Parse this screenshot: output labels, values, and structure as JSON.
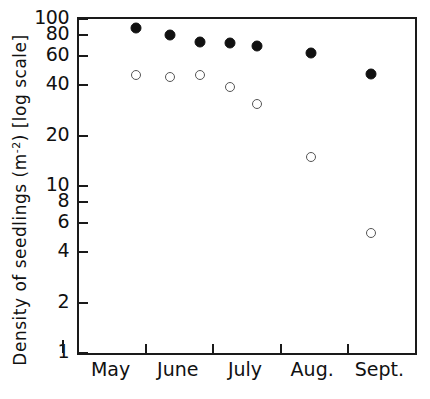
{
  "chart_data": {
    "type": "scatter",
    "title": "",
    "xlabel": "",
    "ylabel": "Density of seedlings (m-2) [log scale]",
    "ylabel_parts": {
      "main": "Density of seedlings (m",
      "sup": "-2",
      "tail": ") [log scale]"
    },
    "yscale": "log",
    "ylim": [
      1,
      100
    ],
    "ytick_values": [
      100,
      80,
      60,
      40,
      20,
      10,
      8,
      6,
      4,
      2,
      1
    ],
    "ytick_labels": [
      "100",
      "80",
      "60",
      "40",
      "20",
      "10",
      "8",
      "6",
      "4",
      "2",
      "1"
    ],
    "categories": [
      "May",
      "June",
      "July",
      "Aug.",
      "Sept."
    ],
    "xtick_labels": [
      "May",
      "June",
      "July",
      "Aug.",
      "Sept."
    ],
    "grid": false,
    "legend": "none",
    "series": [
      {
        "name": "filled-circles",
        "marker": "filled-circle",
        "color": "#111111",
        "x": [
          0.17,
          0.27,
          0.36,
          0.45,
          0.53,
          0.69,
          0.87
        ],
        "values": [
          88,
          80,
          73,
          72,
          69,
          63,
          47
        ]
      },
      {
        "name": "open-circles",
        "marker": "open-circle",
        "color": "#555555",
        "x": [
          0.17,
          0.27,
          0.36,
          0.45,
          0.53,
          0.69,
          0.87
        ],
        "values": [
          46,
          45,
          46,
          39,
          31,
          15,
          5.2
        ]
      }
    ]
  },
  "axes": {
    "frame_color": "#1a1a1a"
  }
}
